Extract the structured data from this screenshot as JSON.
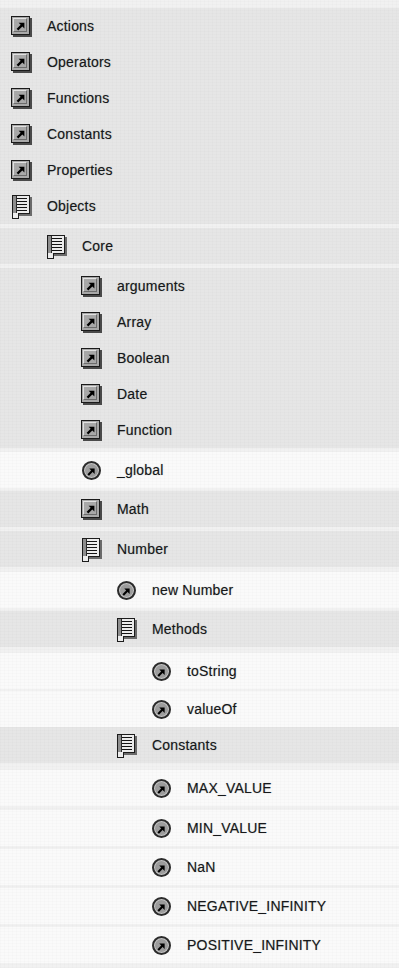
{
  "panel": {
    "name": "actions-toolbox-tree",
    "row_height": 36,
    "indent_step": 35,
    "colors": {
      "background": "#f1f1f1",
      "row_shade": "#e6e6e6",
      "row_plain": "#fafafa",
      "text": "#16181a"
    }
  },
  "tree": {
    "items": [
      {
        "label": "Actions",
        "icon": "shortcut-arrow-icon",
        "level": 0,
        "top": 8,
        "shaded": true
      },
      {
        "label": "Operators",
        "icon": "shortcut-arrow-icon",
        "level": 0,
        "top": 44,
        "shaded": true
      },
      {
        "label": "Functions",
        "icon": "shortcut-arrow-icon",
        "level": 0,
        "top": 80,
        "shaded": true
      },
      {
        "label": "Constants",
        "icon": "shortcut-arrow-icon",
        "level": 0,
        "top": 116,
        "shaded": true
      },
      {
        "label": "Properties",
        "icon": "shortcut-arrow-icon",
        "level": 0,
        "top": 152,
        "shaded": true
      },
      {
        "label": "Objects",
        "icon": "book-icon",
        "level": 0,
        "top": 188,
        "shaded": true
      },
      {
        "label": "Core",
        "icon": "book-icon",
        "level": 1,
        "top": 228,
        "shaded": true
      },
      {
        "label": "arguments",
        "icon": "shortcut-arrow-icon",
        "level": 2,
        "top": 268,
        "shaded": true
      },
      {
        "label": "Array",
        "icon": "shortcut-arrow-icon",
        "level": 2,
        "top": 304,
        "shaded": true
      },
      {
        "label": "Boolean",
        "icon": "shortcut-arrow-icon",
        "level": 2,
        "top": 340,
        "shaded": true
      },
      {
        "label": "Date",
        "icon": "shortcut-arrow-icon",
        "level": 2,
        "top": 376,
        "shaded": true
      },
      {
        "label": "Function",
        "icon": "shortcut-arrow-icon",
        "level": 2,
        "top": 412,
        "shaded": true
      },
      {
        "label": "_global",
        "icon": "method-circle-icon",
        "level": 2,
        "top": 452,
        "shaded": false
      },
      {
        "label": "Math",
        "icon": "shortcut-arrow-icon",
        "level": 2,
        "top": 491,
        "shaded": true
      },
      {
        "label": "Number",
        "icon": "book-icon",
        "level": 2,
        "top": 531,
        "shaded": true
      },
      {
        "label": "new Number",
        "icon": "method-circle-icon",
        "level": 3,
        "top": 572,
        "shaded": false
      },
      {
        "label": "Methods",
        "icon": "book-icon",
        "level": 3,
        "top": 611,
        "shaded": true
      },
      {
        "label": "toString",
        "icon": "method-circle-icon",
        "level": 4,
        "top": 653,
        "shaded": false
      },
      {
        "label": "valueOf",
        "icon": "method-circle-icon",
        "level": 4,
        "top": 691,
        "shaded": false
      },
      {
        "label": "Constants",
        "icon": "book-icon",
        "level": 3,
        "top": 727,
        "shaded": true
      },
      {
        "label": "MAX_VALUE",
        "icon": "method-circle-icon",
        "level": 4,
        "top": 770,
        "shaded": false
      },
      {
        "label": "MIN_VALUE",
        "icon": "method-circle-icon",
        "level": 4,
        "top": 810,
        "shaded": false
      },
      {
        "label": "NaN",
        "icon": "method-circle-icon",
        "level": 4,
        "top": 849,
        "shaded": false
      },
      {
        "label": "NEGATIVE_INFINITY",
        "icon": "method-circle-icon",
        "level": 4,
        "top": 888,
        "shaded": false
      },
      {
        "label": "POSITIVE_INFINITY",
        "icon": "method-circle-icon",
        "level": 4,
        "top": 927,
        "shaded": false
      }
    ]
  }
}
